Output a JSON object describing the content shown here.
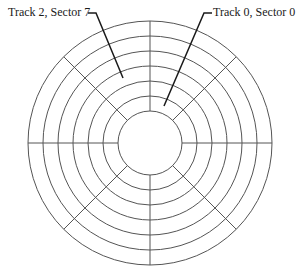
{
  "diagram": {
    "type": "disk-tracks-sectors",
    "center": [
      150,
      143
    ],
    "track_radii": [
      32,
      47,
      62,
      77,
      92,
      107,
      122
    ],
    "sector_count": 8,
    "sector_angles_deg": [
      0,
      45,
      90,
      135,
      180,
      225,
      270,
      315
    ],
    "stroke_color": "#555555",
    "pointer_color": "#1a1a1a"
  },
  "labels": {
    "left": "Track 2, Sector 7",
    "right": "Track 0, Sector 0"
  },
  "pointers": {
    "left": {
      "tick": [
        [
          88,
          13
        ],
        [
          96,
          13
        ]
      ],
      "line": [
        [
          96,
          13
        ],
        [
          123,
          78
        ]
      ]
    },
    "right": {
      "tick": [
        [
          204,
          13
        ],
        [
          212,
          13
        ]
      ],
      "line": [
        [
          204,
          13
        ],
        [
          164,
          106
        ]
      ]
    }
  }
}
